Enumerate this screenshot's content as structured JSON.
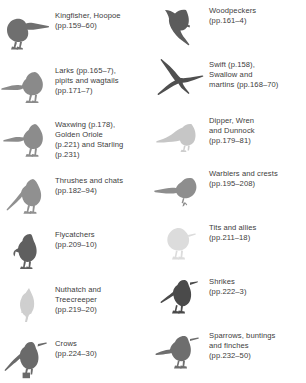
{
  "page": {
    "kind": "bird-family-index",
    "background_color": "#ffffff",
    "text_color": "#3c3c3c"
  },
  "columns": [
    {
      "side": "left",
      "entries": [
        {
          "icon": "kingfisher-silhouette",
          "label": "Kingfisher, Hoopoe\n(pp.159–60)",
          "silhouette_color": "#6f6f6f"
        },
        {
          "icon": "lark-silhouette",
          "label": "Larks (pp.165–7),\npipits and wagtails\n(pp.171–7)",
          "silhouette_color": "#8a8a8a"
        },
        {
          "icon": "waxwing-silhouette",
          "label": "Waxwing (p.178),\nGolden Oriole\n(p.221) and Starling\n(p.231)",
          "silhouette_color": "#8c8c8c"
        },
        {
          "icon": "thrush-silhouette",
          "label": "Thrushes and chats\n(pp.182–94)",
          "silhouette_color": "#909090"
        },
        {
          "icon": "flycatcher-silhouette",
          "label": "Flycatchers\n(pp.209–10)",
          "silhouette_color": "#5f5f5f"
        },
        {
          "icon": "nuthatch-silhouette",
          "label": "Nuthatch and\nTreecreeper\n(pp.219–20)",
          "silhouette_color": "#cfcfcf"
        },
        {
          "icon": "crow-silhouette",
          "label": "Crows\n(pp.224–30)",
          "silhouette_color": "#6a6a6a"
        }
      ]
    },
    {
      "side": "right",
      "entries": [
        {
          "icon": "woodpecker-silhouette",
          "label": "Woodpeckers\n(pp.161–4)",
          "silhouette_color": "#5c5c5c"
        },
        {
          "icon": "swift-silhouette",
          "label": "Swift (p.158),\nSwallow and\nmartins (pp.168–70)",
          "silhouette_color": "#4f4f4f"
        },
        {
          "icon": "dipper-silhouette",
          "label": "Dipper, Wren\nand Dunnock\n(pp.179–81)",
          "silhouette_color": "#c6c6c6"
        },
        {
          "icon": "warbler-silhouette",
          "label": "Warblers and crests\n(pp.195–208)",
          "silhouette_color": "#8e8e8e"
        },
        {
          "icon": "tit-silhouette",
          "label": "Tits and allies\n(pp.211–18)",
          "silhouette_color": "#dcdcdc"
        },
        {
          "icon": "shrike-silhouette",
          "label": "Shrikes\n(pp.222–3)",
          "silhouette_color": "#4a4a4a"
        },
        {
          "icon": "sparrow-silhouette",
          "label": "Sparrows, buntings\nand finches\n(pp.232–50)",
          "silhouette_color": "#6e6e6e"
        }
      ]
    }
  ]
}
